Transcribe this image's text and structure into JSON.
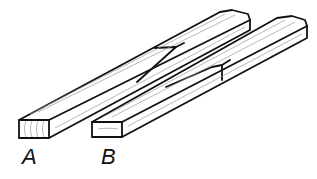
{
  "figure": {
    "boards": [
      {
        "id": "A",
        "label": "A"
      },
      {
        "id": "B",
        "label": "B"
      }
    ],
    "colors": {
      "ink": "#111111",
      "grain": "#9a9a9a",
      "background": "#ffffff"
    }
  }
}
